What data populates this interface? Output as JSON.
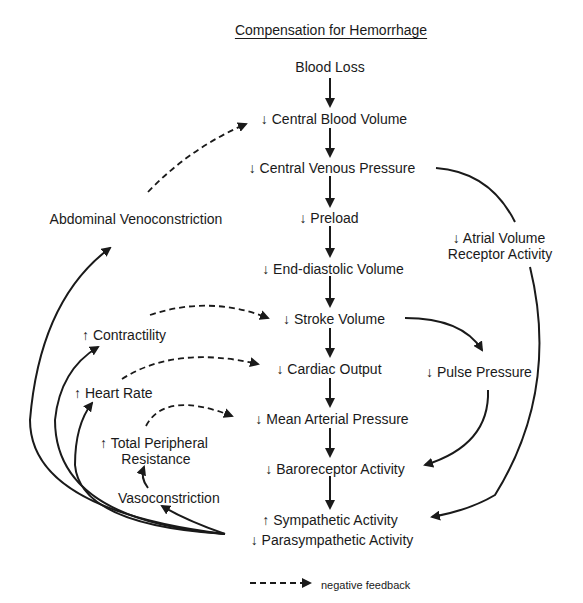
{
  "title": "Compensation for Hemorrhage",
  "nodes": {
    "blood_loss": "Blood Loss",
    "central_blood_volume": "↓ Central Blood Volume",
    "central_venous_pressure": "↓ Central Venous Pressure",
    "preload": "↓ Preload",
    "end_diastolic_volume": "↓ End-diastolic Volume",
    "stroke_volume": "↓ Stroke Volume",
    "cardiac_output": "↓ Cardiac Output",
    "mean_arterial_pressure": "↓ Mean Arterial Pressure",
    "baroreceptor_activity": "↓ Baroreceptor Activity",
    "sympathetic_activity": "↑ Sympathetic Activity",
    "parasympathetic_activity": "↓ Parasympathetic Activity",
    "atrial_line1": "↓ Atrial Volume",
    "atrial_line2": "Receptor Activity",
    "pulse_pressure": "↓ Pulse Pressure",
    "abdominal_line1": "Abdominal Venoconstriction",
    "abdominal_line2": "Splenic Contraction",
    "contractility": "↑ Contractility",
    "heart_rate": "↑ Heart Rate",
    "tpr_line1": "↑ Total Peripheral",
    "tpr_line2": "Resistance",
    "vasoconstriction": "Vasoconstriction"
  },
  "legend": {
    "negative_feedback": "negative feedback"
  },
  "colors": {
    "ink": "#1a1a1a",
    "background": "#ffffff"
  }
}
